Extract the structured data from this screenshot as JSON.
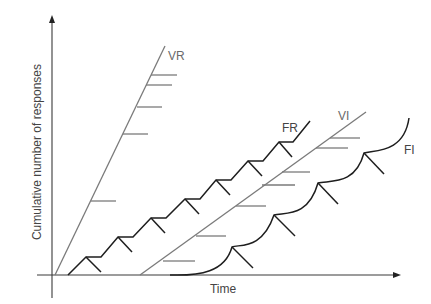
{
  "diagram": {
    "y_axis_label": "Cumulative number of responses",
    "x_axis_label": "Time",
    "curves": [
      {
        "id": "VR",
        "label": "VR",
        "name": "Variable ratio",
        "style": "straight steep line with reinforcement hatch marks"
      },
      {
        "id": "FR",
        "label": "FR",
        "name": "Fixed ratio",
        "style": "staircase with post-reinforcement pauses"
      },
      {
        "id": "VI",
        "label": "VI",
        "name": "Variable interval",
        "style": "straight moderate line with reinforcement hatch marks"
      },
      {
        "id": "FI",
        "label": "FI",
        "name": "Fixed interval",
        "style": "scalloped curve"
      }
    ],
    "colors": {
      "axis": "#3a3a3a",
      "ratio_interval_gray": "#7a7a7a",
      "dark_curve": "#1e1e1e",
      "background": "#ffffff"
    }
  }
}
